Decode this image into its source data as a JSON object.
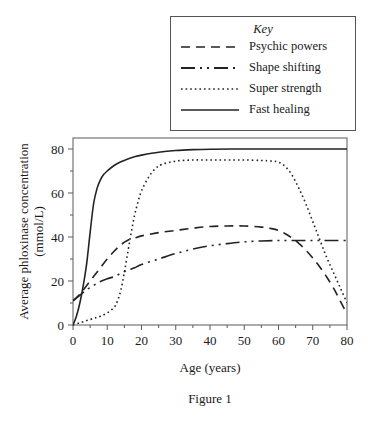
{
  "figure": {
    "caption": "Figure 1"
  },
  "legend": {
    "title": "Key",
    "position": "top-right-outside",
    "items": [
      {
        "label": "Psychic powers",
        "style": "dashed",
        "dash": "9,6",
        "icon": "dashed-line-icon"
      },
      {
        "label": "Shape shifting",
        "style": "dash-dot-dot",
        "dash": "12,4,2,4,2,4",
        "icon": "dash-dot-line-icon"
      },
      {
        "label": "Super strength",
        "style": "dotted",
        "dash": "2,3",
        "icon": "dotted-line-icon"
      },
      {
        "label": "Fast healing",
        "style": "solid",
        "dash": "none",
        "icon": "solid-line-icon"
      }
    ]
  },
  "chart_data": {
    "type": "line",
    "title": "",
    "xlabel": "Age (years)",
    "ylabel": "Average phloxinase concentration (mmol/L)",
    "ylabel_line1": "Average phloxinase concentration",
    "ylabel_line2": "(mmol/L)",
    "xlim": [
      0,
      80
    ],
    "ylim": [
      0,
      85
    ],
    "xticks": [
      0,
      10,
      20,
      30,
      40,
      50,
      60,
      70,
      80
    ],
    "yticks": [
      0,
      20,
      40,
      60,
      80
    ],
    "xtick_labels": [
      "0",
      "10",
      "20",
      "30",
      "40",
      "50",
      "60",
      "70",
      "80"
    ],
    "ytick_labels": [
      "0",
      "20",
      "40",
      "60",
      "80"
    ],
    "x_minor_interval": 5,
    "y_minor_interval": 10,
    "grid": false,
    "series": [
      {
        "name": "Psychic powers",
        "style": "dashed",
        "x": [
          0,
          2,
          4,
          6,
          8,
          10,
          12,
          14,
          16,
          18,
          20,
          25,
          30,
          35,
          40,
          45,
          50,
          55,
          58,
          60,
          62,
          64,
          66,
          68,
          70,
          72,
          74,
          76,
          78,
          80
        ],
        "y": [
          11,
          14,
          18,
          22,
          26,
          30,
          33.5,
          36.5,
          38.5,
          39.5,
          40.5,
          42,
          43,
          44,
          44.8,
          45,
          45,
          44.5,
          43.8,
          43,
          41.5,
          39.5,
          37,
          34,
          30.5,
          26.5,
          22,
          17,
          11,
          5
        ]
      },
      {
        "name": "Shape shifting",
        "style": "dash-dot-dot",
        "x": [
          0,
          2,
          4,
          6,
          8,
          10,
          12,
          14,
          16,
          18,
          20,
          25,
          30,
          35,
          40,
          45,
          50,
          55,
          60,
          65,
          70,
          75,
          80
        ],
        "y": [
          11,
          13.5,
          16,
          18,
          19.8,
          21,
          22,
          23.5,
          25,
          26,
          27.5,
          30,
          32.5,
          34.5,
          36,
          37,
          37.8,
          38.2,
          38.4,
          38.4,
          38.4,
          38.4,
          38.4
        ]
      },
      {
        "name": "Super strength",
        "style": "dotted",
        "x": [
          0,
          2,
          4,
          6,
          8,
          10,
          12,
          13,
          14,
          15,
          16,
          17,
          18,
          19,
          20,
          22,
          24,
          26,
          30,
          35,
          40,
          45,
          50,
          55,
          58,
          60,
          62,
          64,
          66,
          68,
          70,
          72,
          74,
          76,
          78,
          80
        ],
        "y": [
          0,
          1,
          2,
          3,
          4,
          5.5,
          8,
          11,
          16,
          24,
          33,
          42,
          50,
          56,
          61,
          67,
          71,
          73,
          74.5,
          75,
          75,
          75,
          75,
          74.8,
          74.5,
          74,
          72,
          68,
          62,
          55,
          47,
          39,
          31,
          24,
          17,
          10
        ]
      },
      {
        "name": "Fast healing",
        "style": "solid",
        "x": [
          0,
          1,
          2,
          3,
          4,
          5,
          6,
          7,
          8,
          9,
          10,
          12,
          14,
          16,
          18,
          20,
          25,
          30,
          35,
          40,
          50,
          60,
          70,
          80
        ],
        "y": [
          0,
          4,
          10,
          18,
          28,
          42,
          55,
          62,
          66,
          68.5,
          70,
          72.5,
          74.2,
          75.5,
          76.5,
          77.2,
          78.5,
          79.3,
          79.7,
          79.9,
          80,
          80,
          80,
          80
        ]
      }
    ]
  }
}
